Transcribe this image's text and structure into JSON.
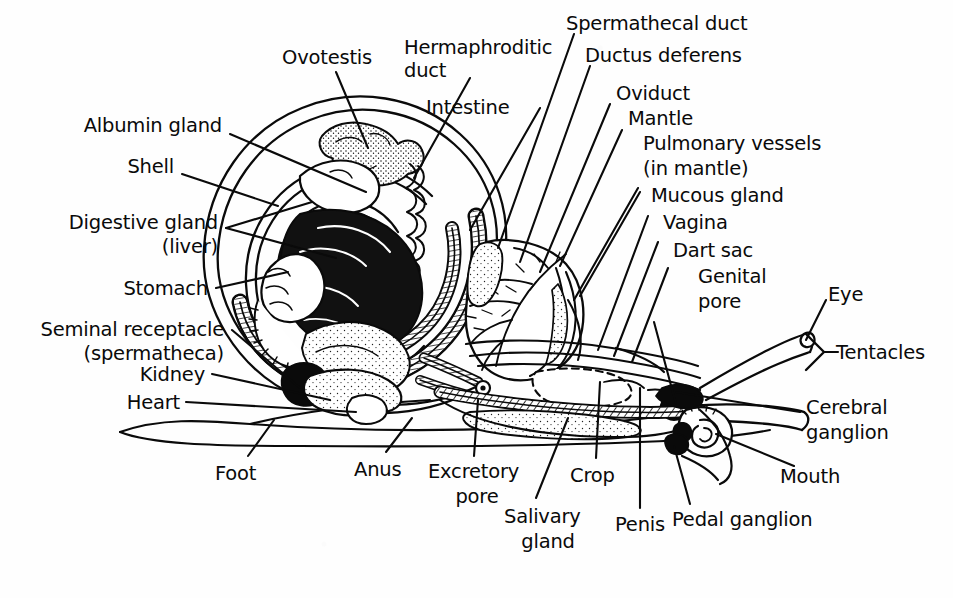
{
  "figure": {
    "ink_color": "#0a0a0a",
    "background_color": "#fefefe",
    "width": 953,
    "height": 598
  },
  "labels": {
    "ovotestis": "Ovotestis",
    "hermaphroditic_duct_l1": "Hermaphroditic",
    "hermaphroditic_duct_l2": "duct",
    "spermathecal_duct": "Spermathecal duct",
    "ductus_deferens": "Ductus deferens",
    "intestine": "Intestine",
    "oviduct": "Oviduct",
    "mantle": "Mantle",
    "pulmonary_vessels_l1": "Pulmonary vessels",
    "pulmonary_vessels_l2": "(in mantle)",
    "mucous_gland": "Mucous gland",
    "vagina": "Vagina",
    "dart_sac": "Dart sac",
    "genital_pore_l1": "Genital",
    "genital_pore_l2": "pore",
    "eye": "Eye",
    "tentacles": "Tentacles",
    "albumin_gland": "Albumin gland",
    "shell": "Shell",
    "digestive_gland_l1": "Digestive gland",
    "digestive_gland_l2": "(liver)",
    "stomach": "Stomach",
    "seminal_receptacle_l1": "Seminal receptacle",
    "seminal_receptacle_l2": "(spermatheca)",
    "kidney": "Kidney",
    "heart": "Heart",
    "foot": "Foot",
    "anus": "Anus",
    "excretory_pore_l1": "Excretory",
    "excretory_pore_l2": "pore",
    "salivary_gland_l1": "Salivary",
    "salivary_gland_l2": "gland",
    "crop": "Crop",
    "penis": "Penis",
    "pedal_ganglion": "Pedal ganglion",
    "cerebral_ganglion_l1": "Cerebral",
    "cerebral_ganglion_l2": "ganglion",
    "mouth": "Mouth"
  },
  "parts": [
    {
      "id": "ovotestis",
      "name": "Ovotestis",
      "region": "shell-apex"
    },
    {
      "id": "hermaphroditic-duct",
      "name": "Hermaphroditic duct",
      "region": "shell-apex"
    },
    {
      "id": "spermathecal-duct",
      "name": "Spermathecal duct",
      "region": "mantle"
    },
    {
      "id": "ductus-deferens",
      "name": "Ductus deferens",
      "region": "mantle"
    },
    {
      "id": "intestine",
      "name": "Intestine",
      "region": "shell-coil"
    },
    {
      "id": "oviduct",
      "name": "Oviduct",
      "region": "mantle"
    },
    {
      "id": "mantle",
      "name": "Mantle",
      "region": "mantle"
    },
    {
      "id": "pulmonary-vessels",
      "name": "Pulmonary vessels (in mantle)",
      "region": "mantle"
    },
    {
      "id": "mucous-gland",
      "name": "Mucous gland",
      "region": "genital"
    },
    {
      "id": "vagina",
      "name": "Vagina",
      "region": "genital"
    },
    {
      "id": "dart-sac",
      "name": "Dart sac",
      "region": "genital"
    },
    {
      "id": "genital-pore",
      "name": "Genital pore",
      "region": "genital"
    },
    {
      "id": "eye",
      "name": "Eye",
      "region": "head"
    },
    {
      "id": "tentacles",
      "name": "Tentacles",
      "region": "head"
    },
    {
      "id": "albumin-gland",
      "name": "Albumin gland",
      "region": "shell-apex"
    },
    {
      "id": "shell",
      "name": "Shell",
      "region": "shell"
    },
    {
      "id": "digestive-gland",
      "name": "Digestive gland (liver)",
      "region": "shell-coil"
    },
    {
      "id": "stomach",
      "name": "Stomach",
      "region": "shell-coil"
    },
    {
      "id": "seminal-receptacle",
      "name": "Seminal receptacle (spermatheca)",
      "region": "shell-coil"
    },
    {
      "id": "kidney",
      "name": "Kidney",
      "region": "shell-coil"
    },
    {
      "id": "heart",
      "name": "Heart",
      "region": "shell-coil"
    },
    {
      "id": "foot",
      "name": "Foot",
      "region": "body"
    },
    {
      "id": "anus",
      "name": "Anus",
      "region": "body"
    },
    {
      "id": "excretory-pore",
      "name": "Excretory pore",
      "region": "body"
    },
    {
      "id": "salivary-gland",
      "name": "Salivary gland",
      "region": "body"
    },
    {
      "id": "crop",
      "name": "Crop",
      "region": "body"
    },
    {
      "id": "penis",
      "name": "Penis",
      "region": "genital"
    },
    {
      "id": "pedal-ganglion",
      "name": "Pedal ganglion",
      "region": "head"
    },
    {
      "id": "cerebral-ganglion",
      "name": "Cerebral ganglion",
      "region": "head"
    },
    {
      "id": "mouth",
      "name": "Mouth",
      "region": "head"
    }
  ]
}
